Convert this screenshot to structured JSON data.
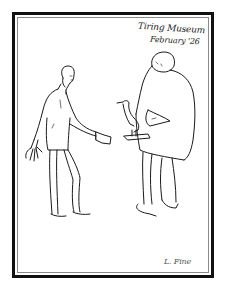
{
  "artwork": {
    "inscription": {
      "line1": "Tiring Museum",
      "line2": "February '26"
    },
    "signature": "L. Fine",
    "subjects": [
      "thin-man-holding-paper",
      "stout-man-holding-bird"
    ],
    "colors": {
      "background": "#ffffff",
      "frame": "#111111",
      "frame_inner_line": "#8a8a8a",
      "ink": "#1a1a1a"
    }
  }
}
